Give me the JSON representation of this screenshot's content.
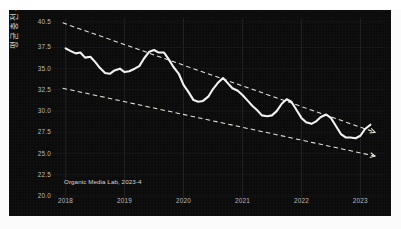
{
  "figure": {
    "title_cropped": "",
    "background_color": "#0b0b0c",
    "series_color": "#f2f2f2",
    "trend_color": "#e8e4d8",
    "tick_color": "#bdbdbd",
    "watermark": "Organic Media Lab, 2023-4"
  },
  "chart_data": {
    "type": "line",
    "title": "",
    "xlabel": "",
    "ylabel": "평균 충전 시간 (분)",
    "xlim": [
      2017.82,
      2023.35
    ],
    "ylim": [
      20.0,
      40.5
    ],
    "grid": true,
    "legend": null,
    "xticklabels": [
      "2018",
      "2019",
      "2020",
      "2021",
      "2022",
      "2023"
    ],
    "xtickvalues": [
      2018,
      2019,
      2020,
      2021,
      2022,
      2023
    ],
    "yticklabels": [
      "40.5",
      "37.5",
      "35.0",
      "32.5",
      "30.0",
      "27.5",
      "25.0",
      "22.5",
      "20.0"
    ],
    "ytickvalues": [
      40.5,
      37.5,
      35.0,
      32.5,
      30.0,
      27.5,
      25.0,
      22.5,
      20.0
    ],
    "series": [
      {
        "name": "평균 충전 시간 (분)",
        "x": [
          2018.0,
          2018.08,
          2018.17,
          2018.25,
          2018.33,
          2018.42,
          2018.5,
          2018.58,
          2018.67,
          2018.75,
          2018.83,
          2018.92,
          2019.0,
          2019.08,
          2019.17,
          2019.25,
          2019.33,
          2019.42,
          2019.5,
          2019.58,
          2019.67,
          2019.75,
          2019.83,
          2019.92,
          2020.0,
          2020.08,
          2020.17,
          2020.25,
          2020.33,
          2020.42,
          2020.5,
          2020.58,
          2020.67,
          2020.75,
          2020.83,
          2020.92,
          2021.0,
          2021.08,
          2021.17,
          2021.25,
          2021.33,
          2021.42,
          2021.5,
          2021.58,
          2021.67,
          2021.75,
          2021.83,
          2021.92,
          2022.0,
          2022.08,
          2022.17,
          2022.25,
          2022.33,
          2022.42,
          2022.5,
          2022.58,
          2022.67,
          2022.75,
          2022.83,
          2022.92,
          2023.0,
          2023.08,
          2023.17
        ],
        "y": [
          37.4,
          37.1,
          36.8,
          36.9,
          36.3,
          36.4,
          35.8,
          35.1,
          34.5,
          34.4,
          34.8,
          35.0,
          34.6,
          34.7,
          35.0,
          35.3,
          36.2,
          37.0,
          37.2,
          36.9,
          36.9,
          36.1,
          35.2,
          34.4,
          33.1,
          32.3,
          31.3,
          31.1,
          31.2,
          31.7,
          32.6,
          33.3,
          33.9,
          33.3,
          32.7,
          32.4,
          31.9,
          31.3,
          30.6,
          30.1,
          29.5,
          29.4,
          29.5,
          30.0,
          30.9,
          31.4,
          31.1,
          30.1,
          29.2,
          28.7,
          28.5,
          28.8,
          29.3,
          29.6,
          29.2,
          28.3,
          27.3,
          26.9,
          26.9,
          26.8,
          27.1,
          27.9,
          28.4
        ]
      }
    ],
    "trendlines": [
      {
        "name": "upper-bound-trend",
        "style": "dashed",
        "arrow": true,
        "x": [
          2017.95,
          2023.25
        ],
        "y": [
          40.4,
          27.5
        ]
      },
      {
        "name": "lower-bound-trend",
        "style": "dashed",
        "arrow": true,
        "x": [
          2017.95,
          2023.25
        ],
        "y": [
          32.7,
          24.7
        ]
      }
    ]
  }
}
